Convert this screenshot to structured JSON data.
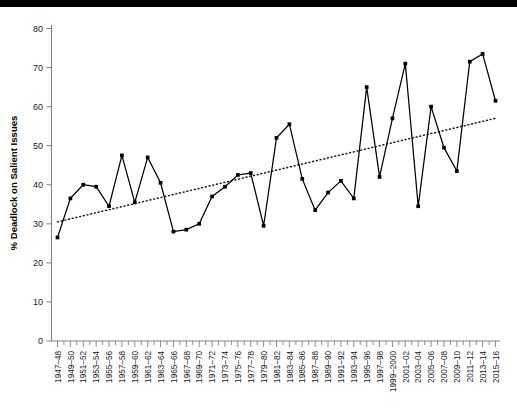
{
  "chart_data": {
    "type": "line",
    "title": "",
    "subtitle": "",
    "xlabel": "",
    "ylabel": "% Deadlock on Salient Issues",
    "ylim": [
      0,
      80
    ],
    "ytick_values": [
      0,
      10,
      20,
      30,
      40,
      50,
      60,
      70,
      80
    ],
    "ytick_labels": [
      "0",
      "10",
      "20",
      "30",
      "40",
      "50",
      "60",
      "70",
      "80"
    ],
    "grid": false,
    "legend": "none",
    "categories": [
      "1947–48",
      "1949–50",
      "1951–52",
      "1953–54",
      "1955–56",
      "1957–58",
      "1959–60",
      "1961–62",
      "1963–64",
      "1965–66",
      "1967–68",
      "1969–70",
      "1971–72",
      "1973–74",
      "1975–76",
      "1977–78",
      "1979–80",
      "1981–82",
      "1983–84",
      "1985–86",
      "1987–88",
      "1989–90",
      "1991–92",
      "1993–94",
      "1995–96",
      "1997–98",
      "1999–2000",
      "2001–02",
      "2003–04",
      "2005–06",
      "2007–08",
      "2009–10",
      "2011–12",
      "2013–14",
      "2015–16"
    ],
    "series": [
      {
        "name": "% Deadlock on Salient Issues",
        "style": "solid-with-markers",
        "color": "#000000",
        "values": [
          26.5,
          36.5,
          40.0,
          39.5,
          34.5,
          47.5,
          35.5,
          47.0,
          40.5,
          28.0,
          28.5,
          30.0,
          37.0,
          39.5,
          42.5,
          43.0,
          29.5,
          52.0,
          55.5,
          41.5,
          33.5,
          38.0,
          41.0,
          36.5,
          65.0,
          42.0,
          57.0,
          71.0,
          34.5,
          60.0,
          49.5,
          43.5,
          71.5,
          73.5,
          61.5
        ]
      }
    ],
    "trendline": {
      "name": "linear trend",
      "style": "dotted",
      "color": "#1a1a1a",
      "start": {
        "category": "1947–48",
        "value": 30.5
      },
      "end": {
        "category": "2015–16",
        "value": 57.0
      }
    }
  },
  "axes": {
    "y_axis_title": "% Deadlock on Salient Issues"
  }
}
